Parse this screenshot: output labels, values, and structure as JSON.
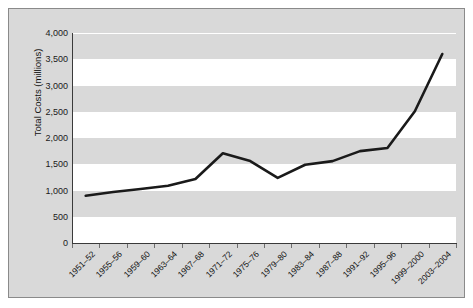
{
  "chart_data": {
    "type": "line",
    "title": "",
    "xlabel": "",
    "ylabel": "Total Costs (millions)",
    "categories": [
      "1951–52",
      "1955–56",
      "1959–60",
      "1963–64",
      "1967–68",
      "1971–72",
      "1975–76",
      "1979–80",
      "1983–84",
      "1987–88",
      "1991–92",
      "1995–96",
      "1999–2000",
      "2003–2004"
    ],
    "values": [
      900,
      970,
      1030,
      1090,
      1220,
      1710,
      1560,
      1240,
      1490,
      1560,
      1750,
      1810,
      2510,
      3600
    ],
    "ytick_labels": [
      "4,000",
      "3,500",
      "3,000",
      "2,500",
      "2,000",
      "1,500",
      "1,000",
      "500",
      "0"
    ],
    "ytick_values": [
      4000,
      3500,
      3000,
      2500,
      2000,
      1500,
      1000,
      500,
      0
    ],
    "ylim": [
      0,
      4000
    ],
    "grid": true,
    "legend": "none",
    "series_color": "#1a1a1a",
    "plot_background": "#d9d9d9",
    "band_color": "#ffffff"
  }
}
